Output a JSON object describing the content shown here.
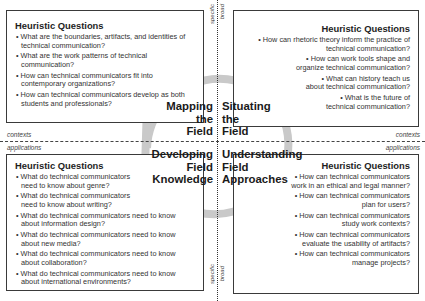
{
  "axes": {
    "horizontal_top": "contexts",
    "horizontal_bottom": "applications",
    "vertical_top_left": "specific",
    "vertical_top_right": "broad",
    "vertical_bottom_left": "specific",
    "vertical_bottom_right": "broad"
  },
  "quadrants": {
    "mapping": [
      "Mapping",
      "the",
      "Field"
    ],
    "situating": [
      "Situating",
      "the",
      "Field"
    ],
    "developing": [
      "Developing",
      "Field",
      "Knowledge"
    ],
    "understanding": [
      "Understanding",
      "Field",
      "Approaches"
    ]
  },
  "boxes": {
    "top_left": {
      "title": "Heuristic Questions",
      "items": [
        "What are the boundaries, artifacts, and identities of technical communication?",
        "What are the work patterns of technical communication?",
        "How can technical communicators fit into contemporary organizations?",
        "How can technical communicators develop as both students and professionals?"
      ]
    },
    "top_right": {
      "title": "Heuristic Questions",
      "items": [
        "How can rhetoric theory inform the practice of technical communication?",
        "How can work tools shape and organize technical communication?",
        "What can history teach us about technical communication?",
        "What is the future of technical communication?"
      ]
    },
    "bottom_left": {
      "title": "Heuristic Questions",
      "items": [
        "What do technical communicators need to know about genre?",
        "What do technical communicators need to know about writing?",
        "What do technical communicators need to know about information design?",
        "What do technical communicators need to know about new media?",
        "What do technical communicators need to know about collaboration?",
        "What do technical communicators need to know about international environments?"
      ]
    },
    "bottom_right": {
      "title": "Heuristic Questions",
      "items": [
        "How can technical communicators work in an ethical and legal manner?",
        "How can technical communicators plan for users?",
        "How can technical communicators study work contexts?",
        "How can technical communicators evaluate the usability of artifacts?",
        "How can technical communicators manage projects?"
      ]
    }
  },
  "bullet": "•",
  "colors": {
    "ring": "#c8c8c8",
    "border": "#3a3a3a",
    "text": "#222222"
  }
}
